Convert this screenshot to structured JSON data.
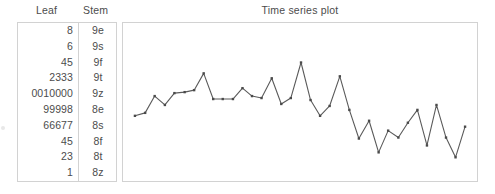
{
  "table": {
    "headers": {
      "leaf": "Leaf",
      "stem": "Stem"
    },
    "rows": [
      {
        "leaf": "8",
        "stem": "9e"
      },
      {
        "leaf": "6",
        "stem": "9s"
      },
      {
        "leaf": "45",
        "stem": "9f"
      },
      {
        "leaf": "2333",
        "stem": "9t"
      },
      {
        "leaf": "0010000",
        "stem": "9z"
      },
      {
        "leaf": "99998",
        "stem": "8e"
      },
      {
        "leaf": "66677",
        "stem": "8s"
      },
      {
        "leaf": "45",
        "stem": "8f"
      },
      {
        "leaf": "23",
        "stem": "8t"
      },
      {
        "leaf": "1",
        "stem": "8z"
      }
    ]
  },
  "plot": {
    "title": "Time series plot"
  },
  "chart_data": {
    "type": "line",
    "title": "Time series plot",
    "xlabel": "",
    "ylabel": "",
    "grid": false,
    "legend": false,
    "marker": "square",
    "line_color": "#5a5a5a",
    "marker_color": "#4a4a4a",
    "x": [
      1,
      2,
      3,
      4,
      5,
      6,
      7,
      8,
      9,
      10,
      11,
      12,
      13,
      14,
      15,
      16,
      17,
      18,
      19,
      20,
      21,
      22,
      23,
      24,
      25,
      26,
      27,
      28,
      29,
      30,
      31,
      32,
      33,
      34,
      35
    ],
    "values": [
      90,
      90,
      93,
      96,
      94,
      95,
      95,
      98,
      92,
      92,
      92,
      95,
      93,
      93,
      96,
      91,
      93,
      100,
      93,
      89,
      92,
      97,
      91,
      86,
      89,
      85,
      88,
      86,
      90,
      91,
      88,
      90,
      86,
      83,
      88
    ],
    "ylim": [
      80,
      101
    ],
    "xlim": [
      0,
      36
    ],
    "points_px": [
      [
        13,
        116
      ],
      [
        28,
        113
      ],
      [
        42,
        96
      ],
      [
        57,
        105
      ],
      [
        71,
        93
      ],
      [
        86,
        92
      ],
      [
        100,
        90
      ],
      [
        114,
        73
      ],
      [
        128,
        99
      ],
      [
        142,
        99
      ],
      [
        157,
        99
      ],
      [
        171,
        88
      ],
      [
        185,
        96
      ],
      [
        199,
        98
      ],
      [
        214,
        78
      ],
      [
        228,
        104
      ],
      [
        242,
        98
      ],
      [
        257,
        62
      ],
      [
        271,
        100
      ],
      [
        285,
        116
      ],
      [
        299,
        106
      ],
      [
        314,
        76
      ],
      [
        328,
        110
      ],
      [
        342,
        139
      ],
      [
        357,
        121
      ],
      [
        371,
        153
      ],
      [
        385,
        131
      ],
      [
        400,
        138
      ],
      [
        414,
        123
      ],
      [
        428,
        110
      ],
      [
        442,
        146
      ],
      [
        456,
        105
      ],
      [
        470,
        138
      ],
      [
        484,
        158
      ],
      [
        498,
        127
      ]
    ]
  }
}
